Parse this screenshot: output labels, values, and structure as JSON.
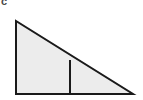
{
  "figure": {
    "label": "c",
    "label_position": "top-left",
    "background_color": "#ffffff",
    "shape_name": "right-triangle-with-interior-divider",
    "fill_color": "#ececec",
    "stroke_color": "#1a1a1a",
    "stroke_width": 2,
    "divider_color": "#1a1a1a",
    "divider_width": 2,
    "triangle_points": "16,21 16,94 133,94",
    "divider_line": {
      "x": 70,
      "y_top": 60,
      "y_bottom": 94
    },
    "vertices": {
      "top_left": "16,21",
      "bottom_left": "16,94",
      "bottom_right": "133,94"
    }
  }
}
